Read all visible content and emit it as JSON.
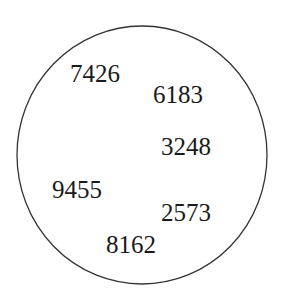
{
  "diagram": {
    "shape": "circle",
    "stroke_color": "#333333",
    "numbers": [
      {
        "value": "7426",
        "x": 70,
        "y": 82
      },
      {
        "value": "6183",
        "x": 153,
        "y": 103
      },
      {
        "value": "3248",
        "x": 161,
        "y": 155
      },
      {
        "value": "9455",
        "x": 52,
        "y": 198
      },
      {
        "value": "2573",
        "x": 161,
        "y": 221
      },
      {
        "value": "8162",
        "x": 106,
        "y": 253
      }
    ]
  }
}
